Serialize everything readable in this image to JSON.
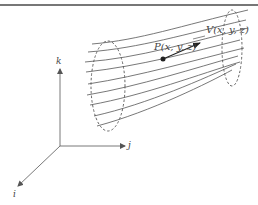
{
  "figure": {
    "colors": {
      "line": "#555555",
      "rule": "#777777",
      "background": "#ffffff"
    },
    "labels": {
      "point": "P(x, y, z)",
      "velocity": "V(x, y, z)",
      "axis_k": "k",
      "axis_j": "j",
      "axis_i": "i"
    },
    "axes": {
      "origin": [
        60,
        146
      ],
      "k_end": [
        60,
        68
      ],
      "j_end": [
        126,
        146
      ],
      "i_end": [
        17,
        186
      ]
    }
  }
}
